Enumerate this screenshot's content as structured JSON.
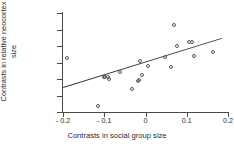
{
  "chart_data": {
    "type": "scatter",
    "title": "",
    "xlabel": "Contrasts in social group size",
    "ylabel": "Contrasts in relative neocortex size",
    "xlim": [
      -0.2,
      0.2
    ],
    "ylim": [
      -0.03,
      0.03
    ],
    "xticks": [
      -0.2,
      -0.1,
      0,
      0.1,
      0.2
    ],
    "xticklabels": [
      "- 0.2",
      "- 0.1",
      "0",
      "0.1",
      "0.2"
    ],
    "yticks": [
      -0.03,
      -0.02,
      -0.01,
      0,
      0.01,
      0.02,
      0.03
    ],
    "yticklabels": [
      "- 0.03",
      "- 0.02",
      "- 0.01",
      "0",
      "0.01",
      "0.02",
      "0.03"
    ],
    "grid": false,
    "legend": null,
    "marker": "open-circle",
    "marker_color": "#555555",
    "line_color": "#3a3a3a",
    "points": [
      {
        "x": -0.19,
        "y": 0.003
      },
      {
        "x": -0.115,
        "y": -0.0262
      },
      {
        "x": -0.101,
        "y": -0.0085
      },
      {
        "x": -0.097,
        "y": -0.009
      },
      {
        "x": -0.092,
        "y": -0.0087
      },
      {
        "x": -0.088,
        "y": -0.01
      },
      {
        "x": -0.063,
        "y": -0.006
      },
      {
        "x": -0.033,
        "y": -0.0161
      },
      {
        "x": -0.019,
        "y": -0.011
      },
      {
        "x": -0.016,
        "y": -0.0105
      },
      {
        "x": -0.014,
        "y": 0.0012
      },
      {
        "x": -0.008,
        "y": -0.0075
      },
      {
        "x": 0.005,
        "y": -0.0022
      },
      {
        "x": 0.048,
        "y": 0.0035
      },
      {
        "x": 0.062,
        "y": -0.0025
      },
      {
        "x": 0.068,
        "y": 0.0228
      },
      {
        "x": 0.077,
        "y": 0.0098
      },
      {
        "x": 0.105,
        "y": 0.0124
      },
      {
        "x": 0.112,
        "y": 0.0127
      },
      {
        "x": 0.118,
        "y": 0.004
      },
      {
        "x": 0.163,
        "y": 0.0065
      }
    ],
    "fit_line": {
      "x_start": -0.2,
      "y_start": -0.015,
      "x_end": 0.185,
      "y_end": 0.0148
    }
  }
}
